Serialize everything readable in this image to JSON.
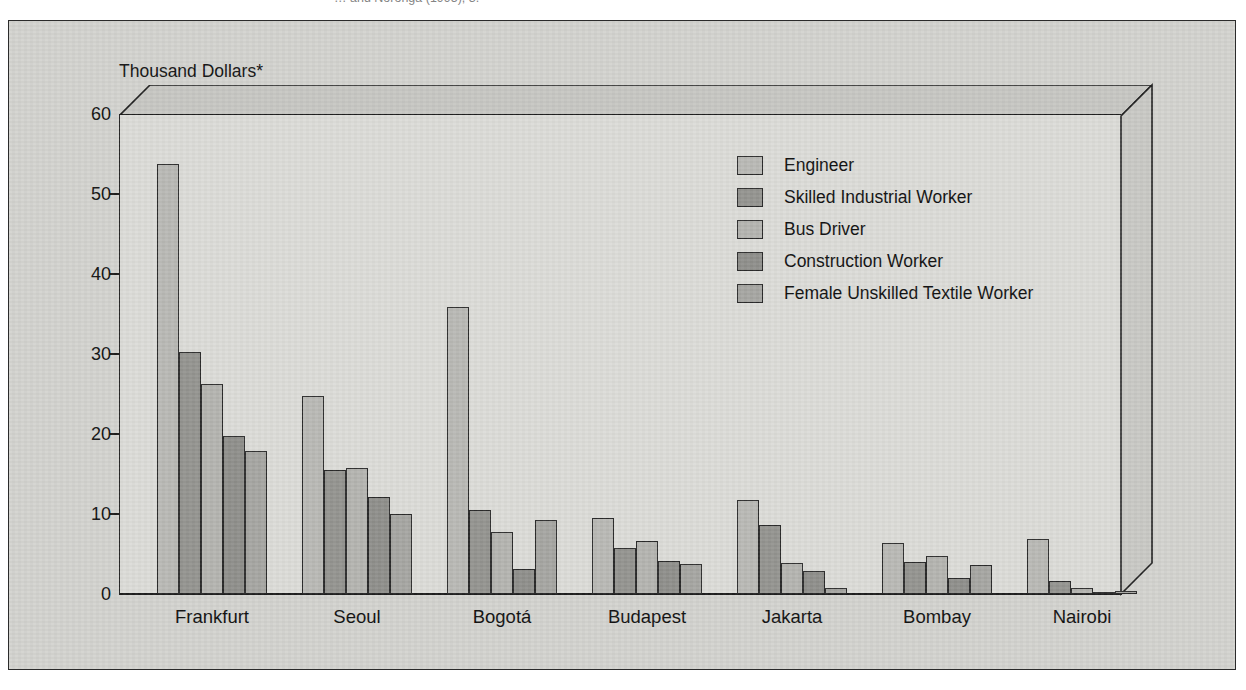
{
  "caption": {
    "text": "… and Noronga (1995), 3."
  },
  "chart_data": {
    "type": "bar",
    "title": "",
    "subtitle": "",
    "ylabel": "Thousand Dollars*",
    "xlabel": "",
    "ylim": [
      0,
      60
    ],
    "yticks": [
      0,
      10,
      20,
      30,
      40,
      50,
      60
    ],
    "ytick_labels": [
      "0",
      "10",
      "20",
      "30",
      "40",
      "50",
      "60"
    ],
    "grid": false,
    "legend_position": "inside-top-right",
    "categories": [
      "Frankfurt",
      "Seoul",
      "Bogotá",
      "Budapest",
      "Jakarta",
      "Bombay",
      "Nairobi"
    ],
    "series": [
      {
        "name": "Engineer",
        "color": "#b9b9b5",
        "values": [
          53.7,
          24.7,
          35.9,
          9.5,
          11.8,
          6.4,
          6.9
        ]
      },
      {
        "name": "Skilled Industrial Worker",
        "color": "#949490",
        "values": [
          30.2,
          15.5,
          10.5,
          5.7,
          8.6,
          4.0,
          1.6
        ]
      },
      {
        "name": "Bus Driver",
        "color": "#b4b4b0",
        "values": [
          26.2,
          15.8,
          7.8,
          6.6,
          3.9,
          4.8,
          0.8
        ]
      },
      {
        "name": "Construction Worker",
        "color": "#8f8f8b",
        "values": [
          19.7,
          12.1,
          3.1,
          4.1,
          2.9,
          2.0,
          0.2
        ]
      },
      {
        "name": "Female Unskilled Textile Worker",
        "color": "#a6a6a2",
        "values": [
          17.9,
          10.0,
          9.3,
          3.8,
          0.8,
          3.6,
          0.4
        ]
      }
    ]
  },
  "colors": {
    "page_background": "#ffffff",
    "figure_background": "#d3d3cf",
    "plot_background": "#dcdcd8",
    "ceiling_face": "#c7c7c3",
    "right_wall_face": "#c9c9c5",
    "axis_line": "#1f1f1f",
    "text": "#111111"
  }
}
